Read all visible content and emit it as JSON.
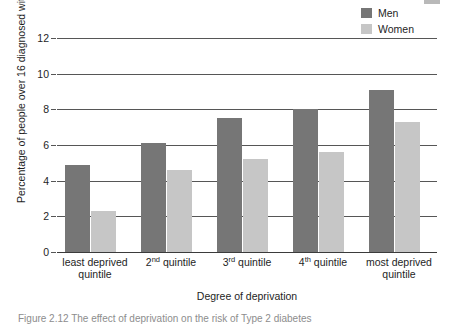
{
  "legend": {
    "position": "top-right",
    "entries": [
      {
        "label": "Men",
        "color": "#767676",
        "swatch_name": "legend-swatch-men"
      },
      {
        "label": "Women",
        "color": "#c6c6c6",
        "swatch_name": "legend-swatch-women"
      }
    ]
  },
  "artifact": {
    "name": "scan-artifact",
    "color": "#b9b9b9"
  },
  "caption": {
    "text": "Figure 2.12 The effect of deprivation on the risk of Type 2 diabetes"
  },
  "chart_data": {
    "type": "bar",
    "title": "",
    "xlabel": "Degree of deprivation",
    "ylabel": "Percentage of people over 16 diagnosed with diabetes",
    "categories": [
      "least deprived quintile",
      "2nd quintile",
      "3rd quintile",
      "4th quintile",
      "most deprived quintile"
    ],
    "category_parts": [
      {
        "main": "least deprived",
        "second": "quintile",
        "ordinal": "",
        "ordinal_sup": ""
      },
      {
        "main": "",
        "second": "",
        "ordinal": "2",
        "ordinal_sup": "nd",
        "rest": " quintile"
      },
      {
        "main": "",
        "second": "",
        "ordinal": "3",
        "ordinal_sup": "rd",
        "rest": " quintile"
      },
      {
        "main": "",
        "second": "",
        "ordinal": "4",
        "ordinal_sup": "th",
        "rest": " quintile"
      },
      {
        "main": "most deprived",
        "second": "quintile",
        "ordinal": "",
        "ordinal_sup": ""
      }
    ],
    "series": [
      {
        "name": "Men",
        "color": "#767676",
        "values": [
          4.9,
          6.1,
          7.5,
          8.0,
          9.1
        ]
      },
      {
        "name": "Women",
        "color": "#c6c6c6",
        "values": [
          2.3,
          4.6,
          5.2,
          5.6,
          7.3
        ]
      }
    ],
    "ylim": [
      0,
      13
    ],
    "yticks": [
      0,
      2,
      4,
      6,
      8,
      10,
      12
    ],
    "ytick_labels": [
      "0",
      "2",
      "4",
      "6",
      "8",
      "10",
      "12"
    ],
    "grid": true,
    "grid_color": "#565656",
    "legend_position": "top-right"
  }
}
